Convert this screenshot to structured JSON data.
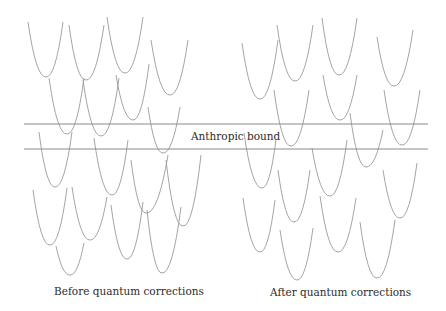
{
  "labels": {
    "bound": "Anthropic bound",
    "before": "Before quantum corrections",
    "after": "After quantum corrections"
  },
  "colors": {
    "curve": "#9a9a9a",
    "line": "#8a8a8a",
    "text": "#2b2b2b"
  },
  "bound_lines": {
    "x1": 24,
    "x2": 428,
    "upper_y": 124,
    "lower_y": 149
  },
  "panels": {
    "before": {
      "wells": [
        [
          28,
          22,
          46,
          77,
          63,
          22
        ],
        [
          69,
          25,
          86,
          80,
          104,
          25
        ],
        [
          107,
          17,
          125,
          73,
          143,
          17
        ],
        [
          151,
          40,
          170,
          95,
          188,
          40
        ],
        [
          49,
          78,
          67,
          134,
          84,
          78
        ],
        [
          83,
          80,
          101,
          136,
          119,
          78
        ],
        [
          116,
          75,
          133,
          120,
          149,
          64
        ],
        [
          148,
          107,
          163,
          153,
          180,
          107
        ],
        [
          39,
          132,
          55,
          187,
          72,
          132
        ],
        [
          94,
          138,
          112,
          195,
          128,
          140
        ],
        [
          131,
          160,
          146,
          213,
          168,
          155
        ],
        [
          166,
          160,
          183,
          226,
          201,
          155
        ],
        [
          33,
          190,
          50,
          245,
          67,
          188
        ],
        [
          72,
          187,
          90,
          240,
          107,
          197
        ],
        [
          111,
          205,
          127,
          259,
          143,
          202
        ],
        [
          147,
          210,
          162,
          273,
          181,
          207
        ],
        [
          56,
          246,
          70,
          275,
          84,
          243
        ]
      ]
    },
    "after": {
      "wells": [
        [
          242,
          43,
          260,
          99,
          278,
          40
        ],
        [
          277,
          25,
          295,
          81,
          313,
          25
        ],
        [
          322,
          18,
          339,
          75,
          357,
          18
        ],
        [
          377,
          37,
          394,
          86,
          413,
          30
        ],
        [
          274,
          90,
          291,
          146,
          309,
          90
        ],
        [
          323,
          75,
          340,
          120,
          357,
          75
        ],
        [
          384,
          90,
          402,
          145,
          420,
          90
        ],
        [
          350,
          113,
          366,
          167,
          383,
          130
        ],
        [
          244,
          133,
          262,
          188,
          276,
          140
        ],
        [
          278,
          170,
          294,
          222,
          310,
          170
        ],
        [
          312,
          148,
          330,
          196,
          347,
          140
        ],
        [
          383,
          170,
          400,
          218,
          417,
          163
        ],
        [
          243,
          198,
          260,
          252,
          275,
          200
        ],
        [
          280,
          230,
          297,
          280,
          313,
          228
        ],
        [
          320,
          196,
          338,
          252,
          356,
          198
        ],
        [
          360,
          222,
          377,
          278,
          395,
          220
        ]
      ]
    }
  }
}
